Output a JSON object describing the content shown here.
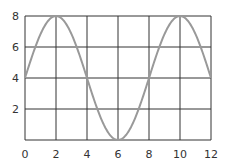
{
  "chart_data": {
    "type": "line",
    "title": "",
    "xlabel": "",
    "ylabel": "",
    "x_ticks": [
      0,
      2,
      4,
      6,
      8,
      10,
      12
    ],
    "y_ticks": [
      2,
      4,
      6,
      8
    ],
    "xlim": [
      0,
      12
    ],
    "ylim": [
      0,
      8
    ],
    "grid": true,
    "legend": null,
    "series": [
      {
        "name": "curve",
        "function": "y = 4 + 4*sin(pi*x/4)",
        "x": [
          0,
          1,
          2,
          3,
          4,
          5,
          6,
          7,
          8,
          9,
          10,
          11,
          12
        ],
        "values": [
          4,
          6.83,
          8,
          6.83,
          4,
          1.17,
          0,
          1.17,
          4,
          6.83,
          8,
          6.83,
          4
        ],
        "color": "#999999"
      }
    ]
  },
  "colors": {
    "grid": "#333333",
    "curve": "#999999",
    "label": "#333333"
  }
}
